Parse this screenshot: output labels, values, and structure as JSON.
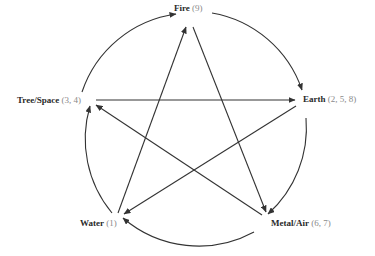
{
  "diagram": {
    "type": "five-element-cycle",
    "nodes": [
      {
        "id": "fire",
        "name": "Fire",
        "numbers": "(9)"
      },
      {
        "id": "earth",
        "name": "Earth",
        "numbers": "(2, 5, 8)"
      },
      {
        "id": "metal",
        "name": "Metal/Air",
        "numbers": "(6, 7)"
      },
      {
        "id": "water",
        "name": "Water",
        "numbers": "(1)"
      },
      {
        "id": "tree",
        "name": "Tree/Space",
        "numbers": "(3, 4)"
      }
    ],
    "circle_edges": [
      {
        "from": "tree",
        "to": "fire"
      },
      {
        "from": "fire",
        "to": "earth"
      },
      {
        "from": "earth",
        "to": "metal"
      },
      {
        "from": "metal",
        "to": "water"
      },
      {
        "from": "water",
        "to": "tree"
      }
    ],
    "star_edges": [
      {
        "from": "water",
        "to": "fire"
      },
      {
        "from": "fire",
        "to": "metal"
      },
      {
        "from": "metal",
        "to": "tree"
      },
      {
        "from": "tree",
        "to": "earth"
      },
      {
        "from": "earth",
        "to": "water"
      }
    ],
    "colors": {
      "line": "#333333",
      "label": "#2a2a2a",
      "number": "#8a8a8a"
    }
  }
}
